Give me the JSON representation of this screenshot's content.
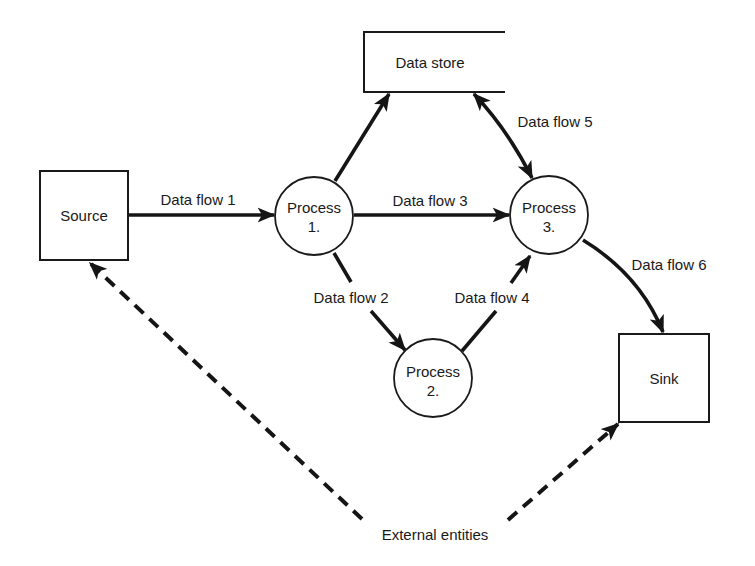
{
  "diagram": {
    "type": "data-flow-diagram",
    "colors": {
      "ink": "#151515",
      "background": "#ffffff"
    },
    "entities": {
      "source": {
        "label": "Source"
      },
      "sink": {
        "label": "Sink"
      },
      "external_label": "External entities"
    },
    "data_store": {
      "label": "Data store"
    },
    "processes": [
      {
        "line1": "Process",
        "line2": "1."
      },
      {
        "line1": "Process",
        "line2": "2."
      },
      {
        "line1": "Process",
        "line2": "3."
      }
    ],
    "flows": [
      {
        "label": "Data flow 1",
        "from": "Source",
        "to": "Process 1."
      },
      {
        "label": "Data flow 2",
        "from": "Process 1.",
        "to": "Process 2."
      },
      {
        "label": "Data flow 3",
        "from": "Process 1.",
        "to": "Process 3."
      },
      {
        "label": "Data flow 4",
        "from": "Process 2.",
        "to": "Process 3."
      },
      {
        "label": "Data flow 5",
        "from": "Data store",
        "to": "Process 3.",
        "bidirectional": true
      },
      {
        "label": "Data flow 6",
        "from": "Process 3.",
        "to": "Sink"
      }
    ]
  }
}
